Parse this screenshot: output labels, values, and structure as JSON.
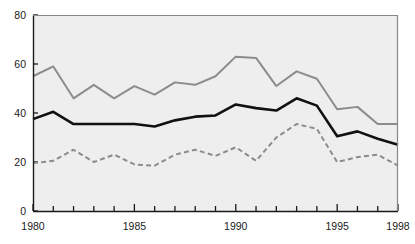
{
  "figure": {
    "top_text_fragment": "",
    "background_color": "#ffffff",
    "plot_background_color": "#eeeeee",
    "plot_border_color": "#888888"
  },
  "chart_data": {
    "type": "line",
    "title": "",
    "subtitle": "",
    "xlabel": "",
    "ylabel": "",
    "xlim": [
      1980,
      1998
    ],
    "ylim": [
      0,
      80
    ],
    "yticks": [
      0,
      20,
      40,
      60,
      80
    ],
    "ytick_labels": [
      "0",
      "20",
      "40",
      "60",
      "80"
    ],
    "xticks": [
      1980,
      1985,
      1990,
      1995,
      1998
    ],
    "xtick_labels": [
      "1980",
      "1985",
      "1990",
      "1995",
      "1998"
    ],
    "x_minor_ticks": [
      1981,
      1982,
      1983,
      1984,
      1986,
      1987,
      1988,
      1989,
      1991,
      1992,
      1993,
      1994,
      1996,
      1997
    ],
    "grid": false,
    "legend_position": "none",
    "x": [
      1980,
      1981,
      1982,
      1983,
      1984,
      1985,
      1986,
      1987,
      1988,
      1989,
      1990,
      1991,
      1992,
      1993,
      1994,
      1995,
      1996,
      1997,
      1998
    ],
    "series": [
      {
        "name": "upper-series",
        "style": "solid",
        "color": "#8c8c8c",
        "width": 2.0,
        "values": [
          55,
          59,
          46,
          51.5,
          46,
          51,
          47.5,
          52.5,
          51.5,
          55,
          63,
          62.5,
          51,
          57,
          54,
          41.5,
          42.5,
          35.5,
          35.5
        ]
      },
      {
        "name": "middle-series",
        "style": "solid",
        "color": "#111111",
        "width": 2.6,
        "values": [
          37.5,
          40.5,
          35.5,
          35.5,
          35.5,
          35.5,
          34.5,
          37,
          38.5,
          39,
          43.5,
          42,
          41,
          46,
          43,
          30.5,
          32.5,
          29.5,
          27
        ]
      },
      {
        "name": "lower-series",
        "style": "dashed",
        "color": "#8c8c8c",
        "width": 2.0,
        "values": [
          19.5,
          20.5,
          25,
          20,
          23,
          19,
          18.5,
          23,
          25,
          22.5,
          26,
          20.5,
          30,
          35.5,
          33.5,
          20,
          22,
          23,
          18.5
        ]
      }
    ]
  }
}
